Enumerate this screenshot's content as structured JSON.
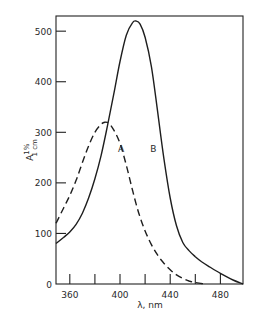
{
  "chart_data": {
    "type": "line",
    "title": "",
    "xlabel": "λ, nm",
    "ylabel": "A 1% 1cm",
    "ylabel_parts": {
      "main": "A",
      "sup": "1%",
      "sub": "1 cm"
    },
    "xlim": [
      349,
      498
    ],
    "ylim": [
      0,
      530
    ],
    "xticks": [
      360,
      370,
      380,
      390,
      400,
      410,
      420,
      430,
      440,
      450,
      460,
      470,
      480
    ],
    "xtick_labels": [
      {
        "value": 360,
        "label": "360"
      },
      {
        "value": 400,
        "label": "400"
      },
      {
        "value": 440,
        "label": "440"
      },
      {
        "value": 480,
        "label": "480"
      }
    ],
    "yticks": [
      {
        "value": 0,
        "label": "0"
      },
      {
        "value": 100,
        "label": "100"
      },
      {
        "value": 200,
        "label": "200"
      },
      {
        "value": 300,
        "label": "300"
      },
      {
        "value": 400,
        "label": "400"
      },
      {
        "value": 500,
        "label": "500"
      }
    ],
    "grid": false,
    "legend": "none (curves labeled inline)",
    "series": [
      {
        "name": "A",
        "style": "dashed",
        "label_at": {
          "x": 398.5,
          "y": 268
        },
        "x": [
          349,
          355,
          360,
          365,
          370,
          375,
          380,
          385,
          388,
          391,
          395,
          400,
          405,
          410,
          415,
          420,
          425,
          430,
          435,
          440,
          445,
          450,
          455,
          460,
          465,
          468
        ],
        "y": [
          120,
          150,
          175,
          205,
          240,
          273,
          300,
          316,
          320,
          318,
          305,
          278,
          235,
          185,
          140,
          105,
          78,
          57,
          41,
          28,
          18,
          11,
          6,
          3,
          1,
          0
        ]
      },
      {
        "name": "B",
        "style": "solid",
        "label_at": {
          "x": 424,
          "y": 268
        },
        "x": [
          349,
          355,
          360,
          365,
          370,
          375,
          380,
          385,
          390,
          395,
          400,
          405,
          410,
          413,
          416,
          420,
          425,
          430,
          435,
          440,
          445,
          450,
          455,
          460,
          465,
          470,
          480,
          490,
          498
        ],
        "y": [
          80,
          92,
          103,
          118,
          140,
          170,
          208,
          255,
          313,
          375,
          440,
          492,
          517,
          520,
          514,
          488,
          430,
          340,
          248,
          170,
          115,
          82,
          66,
          54,
          44,
          36,
          21,
          8,
          0
        ]
      }
    ]
  }
}
